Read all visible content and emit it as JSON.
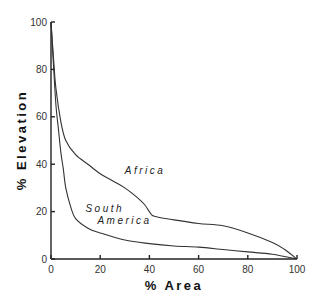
{
  "chart_data": {
    "type": "line",
    "title": "",
    "xlabel": "% Area",
    "ylabel": "% Elevation",
    "xlim": [
      0,
      100
    ],
    "ylim": [
      0,
      100
    ],
    "grid": false,
    "legend": "none (curves labeled inline)",
    "x_ticks": [
      0,
      20,
      40,
      60,
      80,
      100
    ],
    "y_ticks": [
      0,
      20,
      40,
      60,
      80,
      100
    ],
    "series": [
      {
        "name": "Africa",
        "label_lines": [
          "Africa"
        ],
        "label_pos": [
          30,
          36
        ],
        "x": [
          0,
          1,
          2,
          4,
          6,
          10,
          15,
          20,
          25,
          30,
          35,
          38,
          40,
          42,
          50,
          60,
          70,
          80,
          90,
          95,
          100
        ],
        "y": [
          100,
          85,
          72,
          58,
          50,
          44,
          40,
          36,
          33,
          30,
          26,
          23,
          20,
          18,
          16.5,
          15,
          14,
          11,
          7,
          4,
          0
        ]
      },
      {
        "name": "South America",
        "label_lines": [
          "South",
          "America"
        ],
        "label_pos": [
          14,
          20
        ],
        "x": [
          0,
          1,
          2,
          3,
          4,
          5,
          6,
          8,
          10,
          15,
          20,
          30,
          40,
          50,
          60,
          70,
          80,
          90,
          100
        ],
        "y": [
          100,
          82,
          65,
          55,
          45,
          38,
          30,
          22,
          17,
          13,
          11,
          8,
          6.5,
          5.5,
          5,
          4,
          3,
          2,
          0
        ]
      }
    ]
  },
  "layout": {
    "plot_left_px": 51,
    "plot_right_px": 297,
    "plot_top_px": 22,
    "plot_bottom_px": 259
  }
}
